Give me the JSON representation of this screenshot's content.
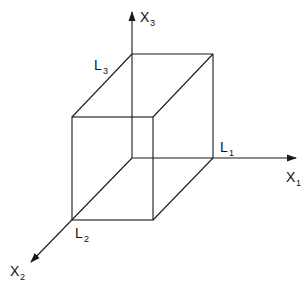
{
  "diagram": {
    "type": "3d-rectangular-box-with-axes",
    "colors": {
      "line": "#1a1a1a",
      "background": "#ffffff"
    },
    "axes": [
      {
        "id": "x1",
        "label": "X",
        "subscript": "1",
        "direction": "right"
      },
      {
        "id": "x2",
        "label": "X",
        "subscript": "2",
        "direction": "down-left"
      },
      {
        "id": "x3",
        "label": "X",
        "subscript": "3",
        "direction": "up"
      }
    ],
    "dimensions": [
      {
        "id": "l1",
        "label": "L",
        "subscript": "1"
      },
      {
        "id": "l2",
        "label": "L",
        "subscript": "2"
      },
      {
        "id": "l3",
        "label": "L",
        "subscript": "3"
      }
    ]
  }
}
